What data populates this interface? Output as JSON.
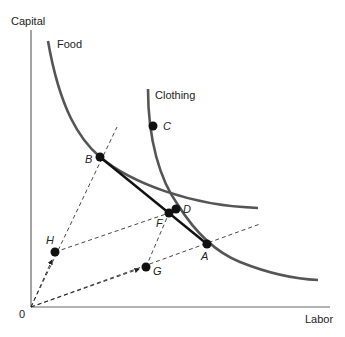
{
  "axes": {
    "y_label": "Capital",
    "x_label": "Labor",
    "origin_label": "0"
  },
  "curves": {
    "food_label": "Food",
    "clothing_label": "Clothing"
  },
  "points": {
    "A": "A",
    "B": "B",
    "C": "C",
    "D": "D",
    "F": "F",
    "G": "G",
    "H": "H"
  },
  "colors": {
    "curve": "#555555",
    "line": "#111111",
    "dashed": "#333333"
  }
}
